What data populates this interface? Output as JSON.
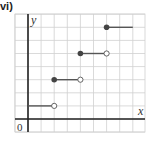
{
  "figure": {
    "part_label": "vi)",
    "x_axis_label": "x",
    "y_axis_label": "y",
    "origin_label": "0"
  },
  "chart_data": {
    "type": "line",
    "subtype": "step-function",
    "title": "",
    "xlabel": "x",
    "ylabel": "y",
    "grid": true,
    "xlim": [
      -1,
      9
    ],
    "ylim": [
      -1,
      8
    ],
    "segments": [
      {
        "x_start": 0,
        "x_end": 2,
        "y": 1,
        "start_closed": false,
        "start_marker": "none",
        "end_marker": "open"
      },
      {
        "x_start": 2,
        "x_end": 4,
        "y": 3,
        "start_marker": "closed",
        "end_marker": "open"
      },
      {
        "x_start": 4,
        "x_end": 6,
        "y": 5,
        "start_marker": "closed",
        "end_marker": "open"
      },
      {
        "x_start": 6,
        "x_end": 8,
        "y": 7,
        "start_marker": "closed",
        "end_marker": "none"
      }
    ],
    "colors": {
      "grid": "#d0d0d0",
      "axis": "#222222",
      "segment": "#555555",
      "closed_dot": "#444444",
      "open_dot_fill": "#ffffff"
    }
  }
}
